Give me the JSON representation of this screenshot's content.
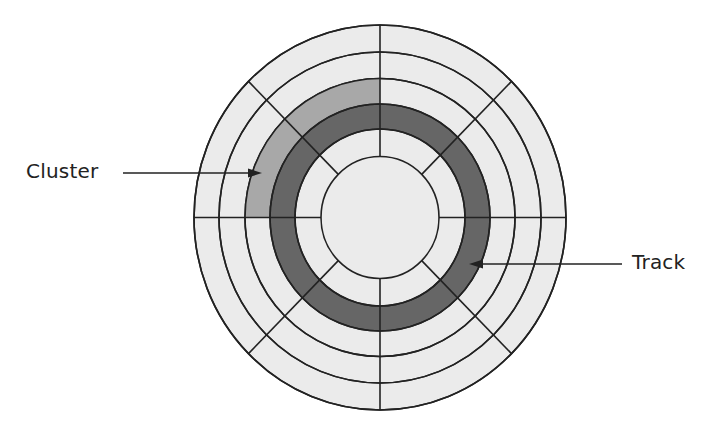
{
  "diagram": {
    "labels": {
      "cluster": "Cluster",
      "track": "Track"
    },
    "colors": {
      "background": "#ffffff",
      "platter_fill": "#ebebeb",
      "track_fill": "#666666",
      "cluster_fill": "#a8a8a8",
      "line": "#222222"
    },
    "geometry": {
      "center": [
        380,
        217.5
      ],
      "rings": [
        {
          "rx": 186,
          "ry": 192.5
        },
        {
          "rx": 161,
          "ry": 165.5
        },
        {
          "rx": 135,
          "ry": 139
        },
        {
          "rx": 110,
          "ry": 113.5
        },
        {
          "rx": 85,
          "ry": 88.5
        },
        {
          "rx": 59,
          "ry": 61
        }
      ],
      "sectors": 8,
      "highlighted_track_ring_index": 3,
      "cluster": {
        "ring_index": 2,
        "start_deg": 180,
        "end_deg": 270
      }
    }
  }
}
